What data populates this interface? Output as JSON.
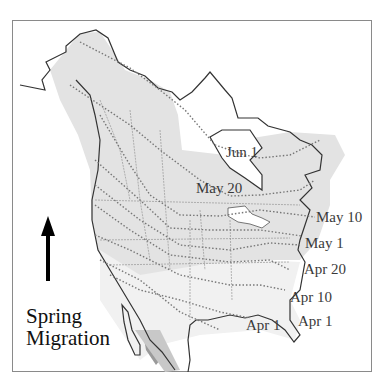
{
  "title": {
    "line1": "Spring",
    "line2": "Migration"
  },
  "arrow": {
    "direction": "north",
    "icon": "up-arrow-icon"
  },
  "isochrone_labels": [
    {
      "text": "Jun 1"
    },
    {
      "text": "May 20"
    },
    {
      "text": "May 10"
    },
    {
      "text": "May 1"
    },
    {
      "text": "Apr 20"
    },
    {
      "text": "Apr 10"
    },
    {
      "text": "Apr 1"
    },
    {
      "text": "Apr 1"
    }
  ],
  "colors": {
    "range_fill": "#e3e3e3",
    "dark_range": "#8c8c8c",
    "coast": "#333333",
    "isochrone": "#777777",
    "border": "#8a8a8a"
  }
}
